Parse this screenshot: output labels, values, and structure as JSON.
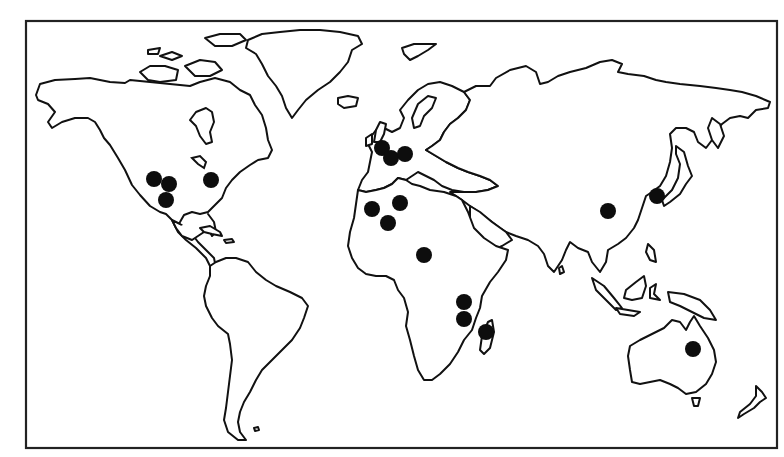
{
  "map": {
    "type": "world-outline-map",
    "projection": "equirectangular-style",
    "frame": {
      "x": 26,
      "y": 21,
      "width": 751,
      "height": 427
    },
    "colors": {
      "background": "#ffffff",
      "outline": "#111111",
      "marker": "#0d0d0d"
    },
    "marker_radius": 8,
    "markers": [
      {
        "region": "North America",
        "x": 154,
        "y": 179
      },
      {
        "region": "North America",
        "x": 169,
        "y": 184
      },
      {
        "region": "North America",
        "x": 166,
        "y": 200
      },
      {
        "region": "North America",
        "x": 211,
        "y": 180
      },
      {
        "region": "Europe",
        "x": 382,
        "y": 148
      },
      {
        "region": "Europe",
        "x": 391,
        "y": 158
      },
      {
        "region": "Europe",
        "x": 405,
        "y": 154
      },
      {
        "region": "North Africa",
        "x": 372,
        "y": 209
      },
      {
        "region": "North Africa",
        "x": 400,
        "y": 203
      },
      {
        "region": "North Africa",
        "x": 388,
        "y": 223
      },
      {
        "region": "Central Africa",
        "x": 424,
        "y": 255
      },
      {
        "region": "East Africa",
        "x": 464,
        "y": 302
      },
      {
        "region": "East Africa",
        "x": 464,
        "y": 319
      },
      {
        "region": "Madagascar",
        "x": 486,
        "y": 332
      },
      {
        "region": "China",
        "x": 608,
        "y": 211
      },
      {
        "region": "Korea",
        "x": 657,
        "y": 196
      },
      {
        "region": "Australia",
        "x": 693,
        "y": 349
      }
    ],
    "marker_count": 17
  }
}
